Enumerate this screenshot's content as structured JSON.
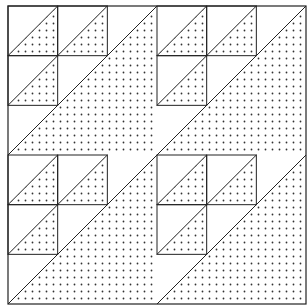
{
  "diagram": {
    "type": "quilt-block-pattern",
    "layout": "2x2 blocks",
    "cells_per_block": 3,
    "line_color": "#222222",
    "dot_color": "#333333",
    "background": "#ffffff"
  }
}
